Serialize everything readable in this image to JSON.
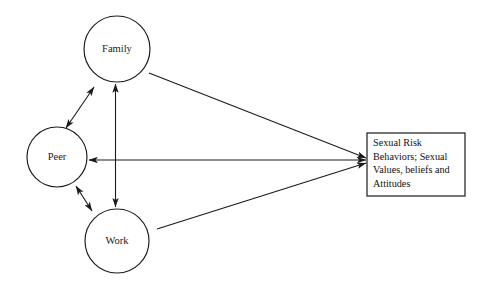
{
  "diagram": {
    "background_color": "#ffffff",
    "stroke_color": "#1a1a1a",
    "nodes": [
      {
        "id": "family",
        "label": "Family",
        "shape": "circle",
        "cx": 117,
        "cy": 49,
        "r": 33
      },
      {
        "id": "peer",
        "label": "Peer",
        "shape": "circle",
        "cx": 57,
        "cy": 157,
        "r": 30
      },
      {
        "id": "work",
        "label": "Work",
        "shape": "circle",
        "cx": 117,
        "cy": 241,
        "r": 32
      }
    ],
    "outcome": {
      "id": "outcome",
      "shape": "rectangle",
      "x": 367,
      "y": 133,
      "width": 98,
      "height": 63,
      "lines": [
        "Sexual Risk",
        "Behaviors;  Sexual",
        "Values,  beliefs and",
        "Attitudes"
      ]
    },
    "edges": [
      {
        "id": "family-peer",
        "from": "family",
        "to": "peer",
        "arrows": "both"
      },
      {
        "id": "family-work",
        "from": "family",
        "to": "work",
        "arrows": "both"
      },
      {
        "id": "peer-work",
        "from": "peer",
        "to": "work",
        "arrows": "both"
      },
      {
        "id": "family-outcome",
        "from": "family",
        "to": "outcome",
        "arrows": "end"
      },
      {
        "id": "peer-outcome",
        "from": "outcome",
        "to": "peer",
        "arrows": "both"
      },
      {
        "id": "work-outcome",
        "from": "work",
        "to": "outcome",
        "arrows": "end"
      }
    ]
  }
}
